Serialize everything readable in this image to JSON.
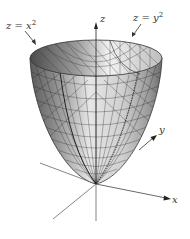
{
  "figure": {
    "surface": "z = x^2 + y^2",
    "traces": [
      {
        "label_base": "z = x",
        "exponent": "2",
        "id": "trace-xz"
      },
      {
        "label_base": "z = y",
        "exponent": "2",
        "id": "trace-yz"
      }
    ],
    "axes": {
      "x": "x",
      "y": "y",
      "z": "z"
    },
    "colors": {
      "mesh_line": "#333333",
      "surface_light": "#e8e8e8",
      "surface_dark": "#6e6e6e",
      "axis": "#555555"
    },
    "caption": ""
  }
}
